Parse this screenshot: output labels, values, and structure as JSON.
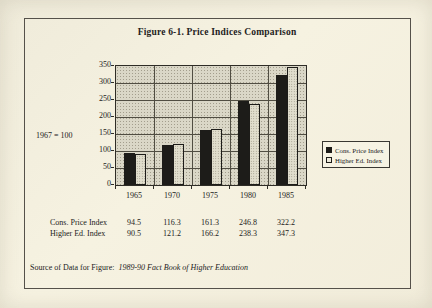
{
  "title": "Figure 6-1. Price Indices Comparison",
  "axis_note": "1967 = 100",
  "chart_data": {
    "type": "bar",
    "title": "Figure 6-1. Price Indices Comparison",
    "note": "1967 = 100",
    "categories": [
      "1965",
      "1970",
      "1975",
      "1980",
      "1985"
    ],
    "series": [
      {
        "name": "Cons. Price Index",
        "values": [
          94.5,
          116.3,
          161.3,
          246.8,
          322.2
        ],
        "color": "#1d1c19",
        "style": "solid-dark"
      },
      {
        "name": "Higher Ed. Index",
        "values": [
          90.5,
          121.2,
          166.2,
          238.3,
          347.3
        ],
        "color": "#e1decd",
        "style": "stippled-light"
      }
    ],
    "xlabel": "",
    "ylabel": "",
    "ylim": [
      0,
      350
    ],
    "yticks": [
      0,
      50,
      100,
      150,
      200,
      250,
      300,
      350
    ],
    "grid": "horizontal and vertical gridlines",
    "legend_position": "right of plot"
  },
  "table": {
    "rows": [
      {
        "label": "Cons. Price Index",
        "values": [
          "94.5",
          "116.3",
          "161.3",
          "246.8",
          "322.2"
        ]
      },
      {
        "label": "Higher Ed. Index",
        "values": [
          "90.5",
          "121.2",
          "166.2",
          "238.3",
          "347.3"
        ]
      }
    ]
  },
  "source": {
    "label": "Source of Data for Figure:",
    "value": "1989-90 Fact Book of Higher Education"
  },
  "colors": {
    "page_bg": "#f4f0df",
    "plot_bg": "#dad7c7",
    "bar_dark": "#1d1c19",
    "bar_light": "#e1decd",
    "grid": "#504d42",
    "frame_border": "#55514a"
  }
}
